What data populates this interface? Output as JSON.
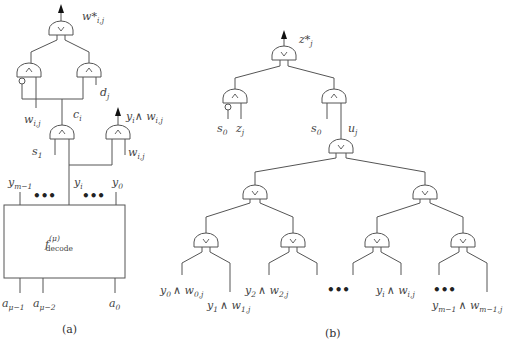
{
  "panel_a": {
    "caption": "(a)",
    "output_label": "w*",
    "output_sub": "i,j",
    "d_label": "d",
    "d_sub": "j",
    "w_left_label": "w",
    "w_left_sub": "i,j",
    "c_label": "c",
    "c_sub": "i",
    "s_label": "s",
    "s_sub": "1",
    "yw_label": "y",
    "yw_sub1": "i",
    "yw_wedge": "∧ w",
    "yw_sub2": "i,j",
    "w_right_label": "w",
    "w_right_sub": "i,j",
    "y_top_left": "y",
    "y_top_left_sub": "m−1",
    "y_mid": "y",
    "y_mid_sub": "i",
    "y_right": "y",
    "y_right_sub": "0",
    "dots": "•••",
    "block_label": "f",
    "block_sup": "(μ)",
    "block_sub": "decode",
    "a1_label": "a",
    "a1_sub": "μ−1",
    "a2_label": "a",
    "a2_sub": "μ−2",
    "a0_label": "a",
    "a0_sub": "0"
  },
  "panel_b": {
    "caption": "(b)",
    "output_label": "z*",
    "output_sub": "j",
    "s0_left": "s",
    "s0_left_sub": "0",
    "z_label": "z",
    "z_sub": "j",
    "s0_right": "s",
    "s0_right_sub": "0",
    "u_label": "u",
    "u_sub": "j",
    "leaves": [
      {
        "y": "y",
        "ysub": "0",
        "w": "∧ w",
        "wsub": "0,j"
      },
      {
        "y": "y",
        "ysub": "1",
        "w": "∧ w",
        "wsub": "1,j"
      },
      {
        "y": "y",
        "ysub": "2",
        "w": "∧ w",
        "wsub": "2,j"
      },
      {
        "y": "y",
        "ysub": "i",
        "w": "∧ w",
        "wsub": "i,j"
      },
      {
        "y": "y",
        "ysub": "m−1",
        "w": "∧ w",
        "wsub": "m−1,j"
      }
    ],
    "dots": "•••"
  },
  "gate_symbols": {
    "and": "∧",
    "or": "∨"
  }
}
